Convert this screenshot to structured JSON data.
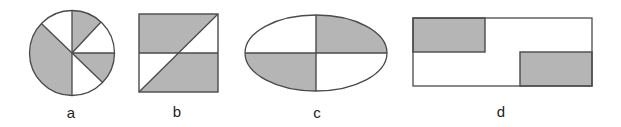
{
  "figure": {
    "colors": {
      "stroke": "#4a4a4a",
      "shaded": "#b5b5b5",
      "unshaded": "#ffffff",
      "label": "#222222"
    },
    "panels": [
      {
        "id": "a",
        "label": "a",
        "shape": "circle",
        "parts": 6,
        "shaded_parts": 3
      },
      {
        "id": "b",
        "label": "b",
        "shape": "square",
        "parts": 4,
        "shaded_parts": 2
      },
      {
        "id": "c",
        "label": "c",
        "shape": "ellipse",
        "parts": 4,
        "shaded_parts": 2
      },
      {
        "id": "d",
        "label": "d",
        "shape": "rectangle",
        "parts": 4,
        "shaded_parts": 2
      }
    ]
  }
}
